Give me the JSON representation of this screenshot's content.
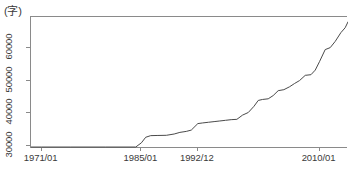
{
  "chart_data": {
    "type": "line",
    "title": "",
    "subtitle": "",
    "xlabel": "",
    "ylabel": "",
    "unit_label": "(字)",
    "grid": false,
    "legend": "none",
    "ylim": [
      29000,
      69500
    ],
    "ytick_labels": [
      "30000",
      "40000",
      "50000",
      "60000"
    ],
    "ytick_values": [
      30000,
      40000,
      50000,
      60000
    ],
    "xtick_labels": [
      "1971/01",
      "1985/01",
      "1992/12",
      "2010/01"
    ],
    "xtick_values": [
      1971.0,
      1985.0,
      1992.92,
      2010.0
    ],
    "xlim": [
      1969.5,
      2014.0
    ],
    "series": [
      {
        "name": "収録字数",
        "color": "#4a4a4a",
        "x": [
          1969.5,
          1971.0,
          1975.0,
          1980.0,
          1984.2,
          1985.0,
          1985.6,
          1986.3,
          1987.2,
          1988.5,
          1989.6,
          1990.4,
          1991.3,
          1992.0,
          1992.92,
          1993.6,
          1994.4,
          1995.2,
          1996.0,
          1996.8,
          1997.6,
          1998.4,
          1999.2,
          2000.0,
          2000.8,
          2001.4,
          2002.0,
          2002.8,
          2003.5,
          2004.2,
          2005.0,
          2005.8,
          2006.5,
          2007.2,
          2008.0,
          2008.8,
          2009.4,
          2010.0,
          2010.8,
          2011.5,
          2012.2,
          2013.0,
          2013.6,
          2014.0
        ],
        "y": [
          29600,
          29600,
          29600,
          29600,
          29600,
          30900,
          32600,
          33100,
          33150,
          33200,
          33600,
          34100,
          34400,
          34800,
          36800,
          37000,
          37200,
          37400,
          37600,
          37800,
          38000,
          38100,
          39400,
          40200,
          42100,
          43900,
          44200,
          44400,
          45400,
          46900,
          47200,
          48100,
          49100,
          50000,
          51600,
          51800,
          53200,
          55800,
          59500,
          60100,
          62000,
          64700,
          66200,
          68000
        ]
      }
    ]
  },
  "axes": {
    "y_ticks": [
      {
        "label": "30000",
        "value": 30000
      },
      {
        "label": "40000",
        "value": 40000
      },
      {
        "label": "50000",
        "value": 50000
      },
      {
        "label": "60000",
        "value": 60000
      }
    ],
    "x_ticks": [
      {
        "label": "1971/01",
        "value": 1971.0
      },
      {
        "label": "1985/01",
        "value": 1985.0
      },
      {
        "label": "1992/12",
        "value": 1992.92
      },
      {
        "label": "2010/01",
        "value": 2010.0
      }
    ]
  },
  "style": {
    "line_color": "#4a4a4a",
    "axis_color": "#8a8a8a",
    "text_color": "#3a3a3a",
    "background": "#ffffff"
  }
}
